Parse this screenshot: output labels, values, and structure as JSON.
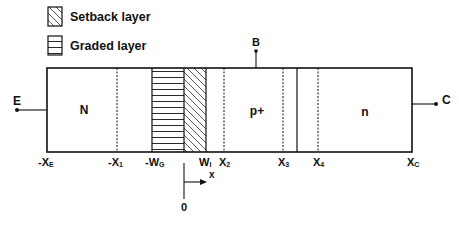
{
  "legend": {
    "items": [
      {
        "label": "Setback layer",
        "pattern": "diagonal-hatch"
      },
      {
        "label": "Graded layer",
        "pattern": "horizontal-hatch"
      }
    ]
  },
  "terminals": {
    "emitter": "E",
    "base": "B",
    "collector": "C"
  },
  "regions": {
    "emitter": "N",
    "base": "p+",
    "collector": "n"
  },
  "axis_labels": [
    {
      "main": "-X",
      "sub": "E"
    },
    {
      "main": "-X",
      "sub": "1"
    },
    {
      "main": "-W",
      "sub": "G"
    },
    {
      "main": "W",
      "sub": "I"
    },
    {
      "main": "X",
      "sub": "2"
    },
    {
      "main": "X",
      "sub": "3"
    },
    {
      "main": "X",
      "sub": "4"
    },
    {
      "main": "X",
      "sub": "C"
    }
  ],
  "origin": {
    "zero_label": "0",
    "axis_label": "x"
  },
  "colors": {
    "line": "#111111",
    "background": "#ffffff",
    "caption_faint": "#c8c8c8"
  }
}
